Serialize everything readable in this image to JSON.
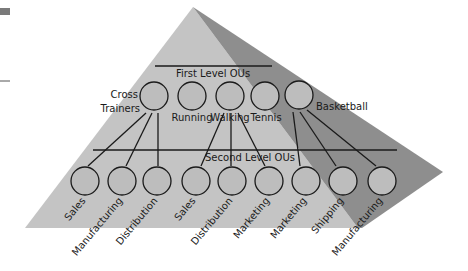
{
  "colors": {
    "background": "#ffffff",
    "light_face": "#c4c4c4",
    "dark_face": "#8e8e8e",
    "circle_fill": "#bdbdbd",
    "stroke": "#1a1a1a",
    "corner_mark": "#7a7a7a"
  },
  "diagram": {
    "first_level_title": "First Level OUs",
    "second_level_title": "Second Level OUs",
    "first_level": [
      {
        "label_line1": "Cross",
        "label_line2": "Trainers"
      },
      {
        "label": "Running"
      },
      {
        "label": "Walking"
      },
      {
        "label": "Tennis"
      },
      {
        "label": "Basketball"
      }
    ],
    "second_level": [
      {
        "label": "Sales",
        "parent": "Cross Trainers"
      },
      {
        "label": "Manufacturing",
        "parent": "Cross Trainers"
      },
      {
        "label": "Distribution",
        "parent": "Cross Trainers"
      },
      {
        "label": "Sales",
        "parent": "Walking"
      },
      {
        "label": "Distribution",
        "parent": "Walking"
      },
      {
        "label": "Marketing",
        "parent": "Walking"
      },
      {
        "label": "Marketing",
        "parent": "Basketball"
      },
      {
        "label": "Shipping",
        "parent": "Basketball"
      },
      {
        "label": "Manufacturing",
        "parent": "Basketball"
      }
    ]
  }
}
